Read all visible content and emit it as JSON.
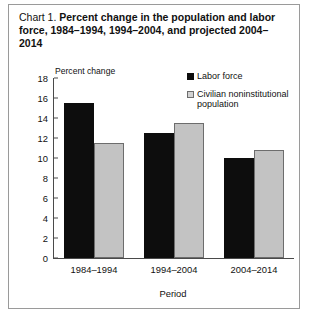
{
  "chart_data": {
    "type": "bar",
    "title": "Chart 1.  Percent change in the population and labor force, 1984–1994, 1994–2004, and projected 2004–2014",
    "title_lead": "Chart 1.",
    "title_bold": "Percent change in the population and labor force, 1984–1994, 1994–2004, and projected 2004–2014",
    "categories": [
      "1984–1994",
      "1994–2004",
      "2004–2014"
    ],
    "series": [
      {
        "name": "Labor force",
        "values": [
          15.5,
          12.5,
          10.0
        ],
        "color": "#0d0d0d"
      },
      {
        "name": "Civilian noninstitutional population",
        "values": [
          11.5,
          13.5,
          10.8
        ],
        "color": "#c3c3c3"
      }
    ],
    "xlabel": "Period",
    "ylabel": "Percent change",
    "ylim": [
      0,
      18
    ],
    "yticks": [
      0,
      2,
      4,
      6,
      8,
      10,
      12,
      14,
      16,
      18
    ],
    "grid": false,
    "legend_position": "top-right"
  }
}
